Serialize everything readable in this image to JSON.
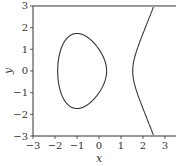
{
  "chart_data": {
    "type": "line",
    "title": "",
    "xlabel": "x",
    "ylabel": "y",
    "xlim": [
      -3,
      3.5
    ],
    "ylim": [
      -3,
      3
    ],
    "xticks": [
      "−3",
      "−2",
      "−1",
      "0",
      "1",
      "2",
      "3"
    ],
    "yticks": [
      "−3",
      "−2",
      "−1",
      "0",
      "1",
      "2",
      "3"
    ],
    "grid": false,
    "legend": null,
    "curve": "y^2 = x^3 - 3x + 1",
    "series": [
      {
        "name": "closed-loop",
        "x": [
          -1.879,
          -1.8,
          -1.5,
          -1.0,
          -0.5,
          0.0,
          0.2,
          0.347
        ],
        "y_upper": [
          0,
          0.78,
          1.41,
          1.73,
          1.62,
          1.0,
          0.63,
          0
        ]
      },
      {
        "name": "open-branch",
        "x": [
          1.532,
          1.6,
          1.8,
          2.0,
          2.2,
          2.47
        ],
        "y_upper": [
          0,
          0.58,
          1.17,
          1.73,
          2.32,
          3.0
        ]
      }
    ],
    "colors": {
      "line": "#333333",
      "axes": "#333333"
    }
  }
}
